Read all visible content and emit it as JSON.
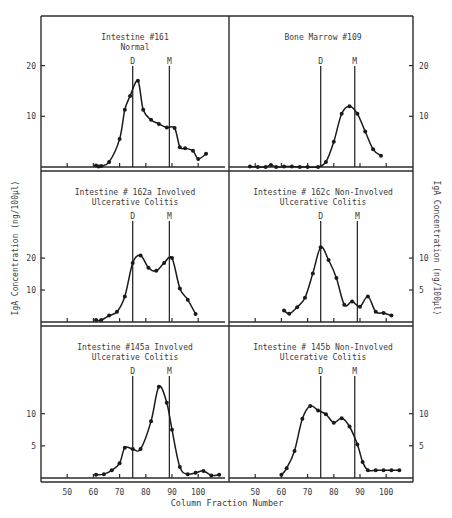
{
  "figure": {
    "xlabel": "Column Fraction Number",
    "ylabel_left": "IgA Concentration (ng/100μl)",
    "ylabel_right": "IgA Concentration (ng/100μl)"
  },
  "chart_data": [
    {
      "type": "line",
      "title": "Intestine #161 Normal",
      "title_lines": [
        "Intestine #161",
        "Normal"
      ],
      "xlabel": "Column Fraction Number",
      "ylabel": "IgA Concentration (ng/100μl)",
      "y_ticks": [
        10,
        20
      ],
      "ylim": [
        0,
        29
      ],
      "markers": [
        {
          "label": "D",
          "x": 75
        },
        {
          "label": "M",
          "x": 89
        }
      ],
      "x": [
        61,
        62,
        63,
        66,
        70,
        72,
        74,
        77,
        79,
        82,
        85,
        88,
        91,
        93,
        95,
        98,
        100,
        103
      ],
      "values": [
        0.3,
        0.1,
        0.2,
        1.0,
        5.5,
        11.3,
        14.0,
        17.0,
        11.3,
        9.3,
        8.5,
        7.8,
        7.7,
        3.9,
        3.7,
        3.2,
        1.6,
        2.6
      ]
    },
    {
      "type": "line",
      "title": "Bone Marrow #109",
      "title_lines": [
        "Bone Marrow #109"
      ],
      "xlabel": "Column Fraction Number",
      "ylabel": "IgA Concentration (ng/100μl)",
      "y_ticks": [
        10,
        20
      ],
      "ylim": [
        0,
        29
      ],
      "markers": [
        {
          "label": "D",
          "x": 75
        },
        {
          "label": "M",
          "x": 88
        }
      ],
      "x": [
        48,
        51,
        54,
        56,
        58,
        61,
        64,
        67,
        70,
        74,
        77,
        80,
        83,
        86,
        89,
        92,
        95,
        98
      ],
      "values": [
        0.1,
        0.0,
        0.0,
        0.4,
        0.0,
        0.1,
        0.1,
        0.0,
        0.0,
        0.0,
        1.0,
        5.0,
        10.5,
        12.0,
        10.5,
        7.0,
        3.5,
        2.2
      ]
    },
    {
      "type": "line",
      "title": "Intestine # 162a Involved Ulcerative Colitis",
      "title_lines": [
        "Intestine # 162a Involved",
        "Ulcerative Colitis"
      ],
      "xlabel": "Column Fraction Number",
      "ylabel": "IgA Concentration (ng/100μl)",
      "y_ticks": [
        10,
        20
      ],
      "ylim": [
        0,
        46
      ],
      "markers": [
        {
          "label": "D",
          "x": 75
        },
        {
          "label": "M",
          "x": 89
        }
      ],
      "x": [
        61,
        63,
        66,
        69,
        72,
        75,
        78,
        81,
        84,
        87,
        90,
        93,
        96,
        99
      ],
      "values": [
        0.6,
        0.6,
        2.0,
        3.2,
        8.0,
        18.5,
        20.8,
        17.0,
        16.0,
        18.5,
        20.0,
        10.5,
        7.0,
        2.5
      ]
    },
    {
      "type": "line",
      "title": "Intestine # 162c Non-Involved Ulcerative Colitis",
      "title_lines": [
        "Intestine # 162c Non-Involved",
        "Ulcerative Colitis"
      ],
      "xlabel": "Column Fraction Number",
      "ylabel": "IgA Concentration (ng/100μl)",
      "y_ticks": [
        5,
        10
      ],
      "ylim": [
        0,
        23
      ],
      "markers": [
        {
          "label": "D",
          "x": 75
        },
        {
          "label": "M",
          "x": 89
        }
      ],
      "x": [
        61,
        63,
        66,
        69,
        72,
        75,
        78,
        81,
        84,
        87,
        90,
        93,
        96,
        99,
        102
      ],
      "values": [
        1.8,
        1.3,
        2.3,
        3.8,
        7.6,
        11.7,
        9.7,
        6.9,
        2.7,
        3.2,
        2.4,
        4.0,
        1.6,
        1.4,
        1.0
      ]
    },
    {
      "type": "line",
      "title": "Intestine #145a Involved Ulcerative Colitis",
      "title_lines": [
        "Intestine #145a Involved",
        "Ulcerative Colitis"
      ],
      "xlabel": "Column Fraction Number",
      "ylabel": "IgA Concentration (ng/100μl)",
      "x_ticks": [
        50,
        60,
        70,
        80,
        90,
        100
      ],
      "y_ticks": [
        5,
        10
      ],
      "ylim": [
        0,
        23
      ],
      "markers": [
        {
          "label": "D",
          "x": 75
        },
        {
          "label": "M",
          "x": 89
        }
      ],
      "x": [
        61,
        64,
        67,
        70,
        72,
        75,
        78,
        82,
        85,
        88,
        90,
        93,
        96,
        99,
        102,
        105,
        108
      ],
      "values": [
        0.5,
        0.6,
        1.2,
        2.3,
        4.7,
        4.5,
        4.5,
        8.8,
        14.2,
        11.7,
        7.5,
        1.7,
        0.6,
        0.8,
        1.1,
        0.4,
        0.5
      ]
    },
    {
      "type": "line",
      "title": "Intestine # 145b Non-Involved Ulcerative Colitis",
      "title_lines": [
        "Intestine # 145b Non-Involved",
        "Ulcerative Colitis"
      ],
      "xlabel": "Column Fraction Number",
      "ylabel": "IgA Concentration (ng/100μl)",
      "x_ticks": [
        50,
        60,
        70,
        80,
        90,
        100
      ],
      "y_ticks": [
        5,
        10
      ],
      "ylim": [
        0,
        23
      ],
      "markers": [
        {
          "label": "D",
          "x": 75
        },
        {
          "label": "M",
          "x": 88
        }
      ],
      "x": [
        60,
        62,
        65,
        68,
        71,
        74,
        77,
        80,
        83,
        86,
        89,
        91,
        93,
        96,
        99,
        102,
        105
      ],
      "values": [
        0.5,
        1.5,
        4.2,
        9.2,
        11.2,
        10.5,
        9.9,
        8.6,
        9.3,
        8.0,
        5.2,
        2.5,
        1.2,
        1.2,
        1.2,
        1.2,
        1.2
      ]
    }
  ]
}
